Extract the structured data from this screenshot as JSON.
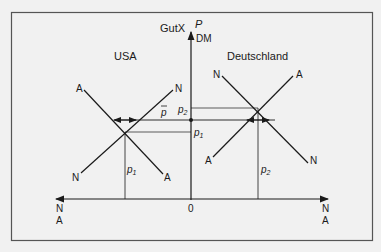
{
  "diagram": {
    "title_axis": "GutX",
    "axis": {
      "y_label": "P",
      "y_unit": "DM",
      "origin": "0",
      "left_end_top": "N",
      "left_end_bottom": "A",
      "right_end_top": "N",
      "right_end_bottom": "A"
    },
    "countries": {
      "left": "USA",
      "right": "Deutschland"
    },
    "usa_curves": {
      "supply_top": "A",
      "demand_top": "N",
      "demand_bottom": "N",
      "supply_bottom": "A",
      "price_label": "p",
      "price_sub": "1"
    },
    "de_curves": {
      "demand_top": "N",
      "supply_top": "A",
      "supply_bottom": "A",
      "demand_bottom": "N",
      "price_label": "p",
      "price_sub": "2"
    },
    "price_levels": {
      "p_bar": "p",
      "p2": "p",
      "p2_sub": "2",
      "p1": "p",
      "p1_sub": "1"
    },
    "colors": {
      "line": "#1a1a1a",
      "frame": "#555555",
      "background": "#f1f1f1"
    }
  }
}
